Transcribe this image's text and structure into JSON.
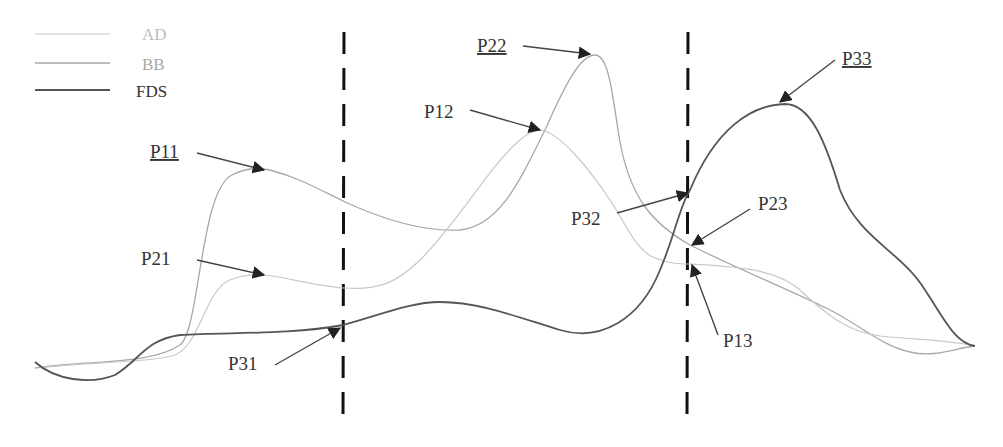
{
  "legend": {
    "items": [
      {
        "label": "AD",
        "color": "#c8c8c8",
        "stroke_width": 1.2
      },
      {
        "label": "BB",
        "color": "#a8a8a8",
        "stroke_width": 1.3
      },
      {
        "label": "FDS",
        "color": "#555555",
        "stroke_width": 1.8
      }
    ]
  },
  "dividers": [
    {
      "x": 343,
      "style": "dashed"
    },
    {
      "x": 688,
      "style": "dashed"
    }
  ],
  "points": [
    {
      "id": "P11",
      "label": "P11",
      "underlined": true,
      "curve": "BB"
    },
    {
      "id": "P12",
      "label": "P12",
      "underlined": false,
      "curve": "AD"
    },
    {
      "id": "P13",
      "label": "P13",
      "underlined": false,
      "curve": "AD"
    },
    {
      "id": "P21",
      "label": "P21",
      "underlined": false,
      "curve": "AD"
    },
    {
      "id": "P22",
      "label": "P22",
      "underlined": true,
      "curve": "BB"
    },
    {
      "id": "P23",
      "label": "P23",
      "underlined": false,
      "curve": "BB"
    },
    {
      "id": "P31",
      "label": "P31",
      "underlined": false,
      "curve": "FDS"
    },
    {
      "id": "P32",
      "label": "P32",
      "underlined": false,
      "curve": "FDS"
    },
    {
      "id": "P33",
      "label": "P33",
      "underlined": true,
      "curve": "FDS"
    }
  ],
  "colors": {
    "divider": "#111111",
    "arrow": "#444444",
    "label": "#333333"
  }
}
